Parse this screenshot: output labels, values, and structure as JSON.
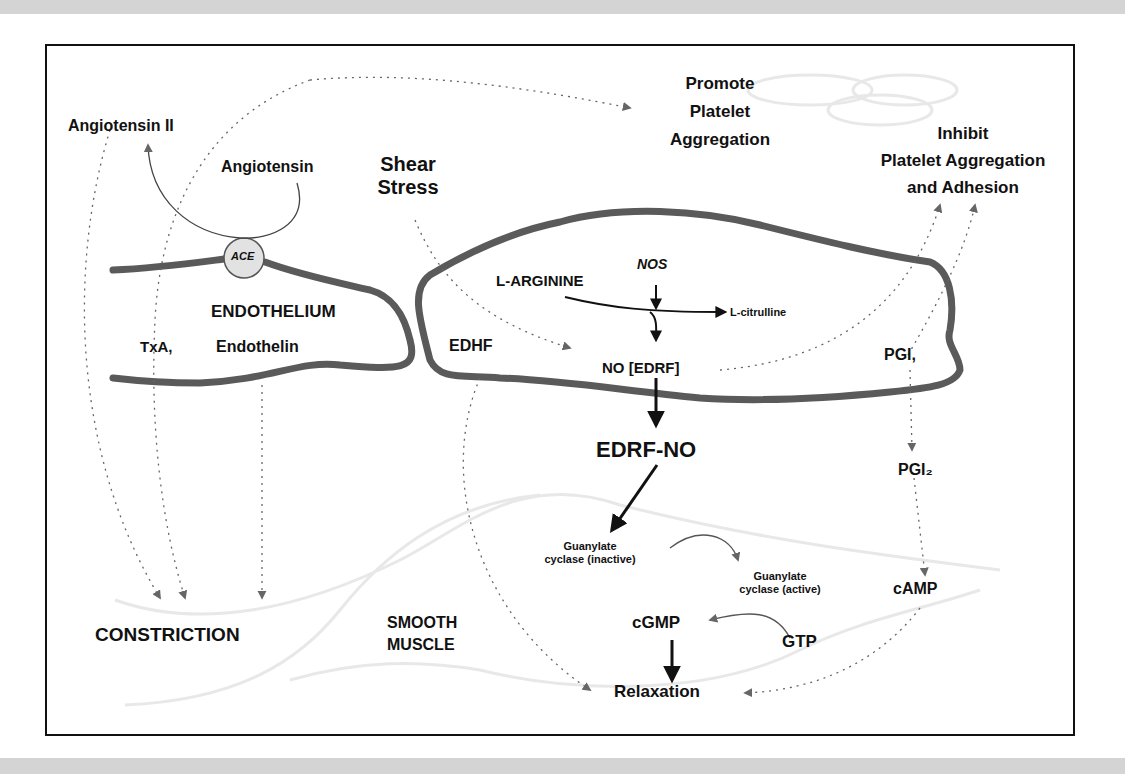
{
  "diagram": {
    "title_regions": {
      "endothelium": "ENDOTHELIUM",
      "smooth_muscle_line1": "SMOOTH",
      "smooth_muscle_line2": "MUSCLE"
    },
    "labels": {
      "angiotensin_ii": "Angiotensin II",
      "angiotensin": "Angiotensin",
      "ace": "ACE",
      "shear_stress_line1": "Shear",
      "shear_stress_line2": "Stress",
      "promote_line1": "Promote",
      "promote_line2": "Platelet",
      "promote_line3": "Aggregation",
      "inhibit_line1": "Inhibit",
      "inhibit_line2": "Platelet Aggregation",
      "inhibit_line3": "and Adhesion",
      "txa2": "TxA,",
      "endothelin": "Endothelin",
      "edhf": "EDHF",
      "l_arginine": "L-ARGININE",
      "nos": "NOS",
      "l_citrulline": "L-citrulline",
      "no_edrf": "NO [EDRF]",
      "pgi2_endo": "PGI,",
      "edrf_no": "EDRF-NO",
      "pgi2_muscle": "PGI₂",
      "gc_inactive_line1": "Guanylate",
      "gc_inactive_line2": "cyclase (inactive)",
      "gc_active_line1": "Guanylate",
      "gc_active_line2": "cyclase (active)",
      "camp": "cAMP",
      "cgmp": "cGMP",
      "gtp": "GTP",
      "constriction": "CONSTRICTION",
      "relaxation": "Relaxation"
    },
    "colors": {
      "membrane": "#5a5a5a",
      "text": "#111111",
      "dotted_arrow": "#666666",
      "ace_fill": "#e2e2e2",
      "muscle_outline": "#e6e6e6"
    }
  }
}
